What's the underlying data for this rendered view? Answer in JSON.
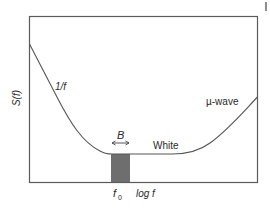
{
  "diagram": {
    "y_axis_label": "S(f)",
    "x_axis_label": "log f",
    "center_frequency_label": "f",
    "center_frequency_subscript": "0",
    "bandwidth_label": "B",
    "regions": [
      {
        "id": "flicker",
        "label": "1/f"
      },
      {
        "id": "white",
        "label": "White"
      },
      {
        "id": "microwave",
        "label": "µ-wave"
      }
    ],
    "colors": {
      "frame": "#555555",
      "curve": "#555555",
      "band_fill": "#6e6e6e",
      "text": "#2a2a2a"
    },
    "corner_mark": "|"
  }
}
